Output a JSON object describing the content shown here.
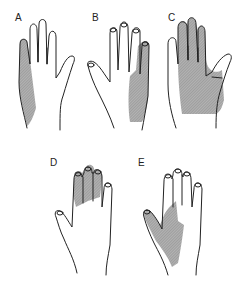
{
  "figure": {
    "panels": [
      {
        "label": "A",
        "view": "palmar",
        "shaded_region": "ulnar border (little finger and hypothenar)"
      },
      {
        "label": "B",
        "view": "dorsal",
        "shaded_region": "ulnar dorsum of hand, ring and little fingers"
      },
      {
        "label": "C",
        "view": "palmar",
        "shaded_region": "radial palm, thumb-side fingers"
      },
      {
        "label": "D",
        "view": "dorsal",
        "shaded_region": "dorsal distal index, middle and ring fingers"
      },
      {
        "label": "E",
        "view": "dorsal",
        "shaded_region": "radial dorsum of hand and thumb web"
      }
    ],
    "colors": {
      "outline": "#222222",
      "shade": "#9a9a9a",
      "background": "#ffffff"
    }
  }
}
